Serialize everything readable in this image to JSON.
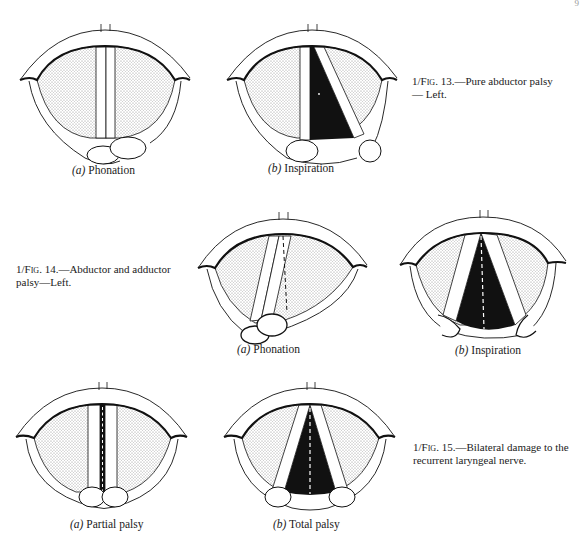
{
  "page": {
    "page_mark": "9"
  },
  "figures": [
    {
      "id": "fig13",
      "prefix": "1/",
      "fig_word": "Fig",
      "number": "13.",
      "caption": "—Pure abductor palsy— Left.",
      "panels": [
        {
          "letter": "(a)",
          "label": "Phonation",
          "state": "phonation-adducted"
        },
        {
          "letter": "(b)",
          "label": "Inspiration",
          "state": "inspiration-left-fixed"
        }
      ]
    },
    {
      "id": "fig14",
      "prefix": "1/",
      "fig_word": "Fig",
      "number": "14.",
      "caption": "—Abductor and adductor palsy—Left.",
      "panels": [
        {
          "letter": "(a)",
          "label": "Phonation",
          "state": "phonation-cross-midline"
        },
        {
          "letter": "(b)",
          "label": "Inspiration",
          "state": "inspiration-cadaveric"
        }
      ]
    },
    {
      "id": "fig15",
      "prefix": "1/",
      "fig_word": "Fig",
      "number": "15.",
      "caption": "—Bilateral damage to the recurrent laryngeal nerve.",
      "panels": [
        {
          "letter": "(a)",
          "label": "Partial palsy",
          "state": "bilateral-partial"
        },
        {
          "letter": "(b)",
          "label": "Total palsy",
          "state": "bilateral-total"
        }
      ]
    }
  ],
  "colors": {
    "ink": "#111111",
    "stipple": "#b8b8b8",
    "glottis_open": "#111111",
    "paper": "#ffffff"
  }
}
